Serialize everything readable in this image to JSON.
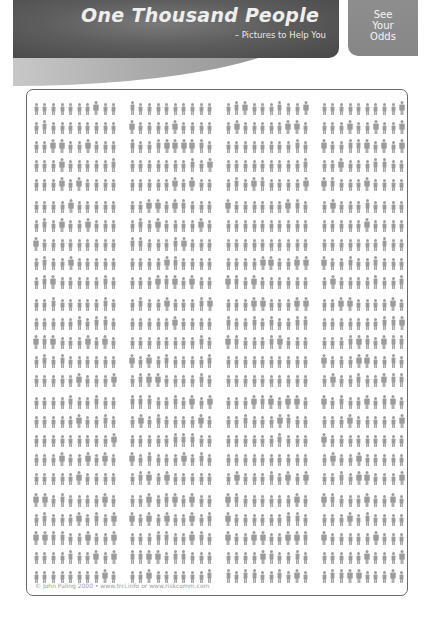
{
  "header": {
    "title": "One Thousand People",
    "subtitle": "– Pictures to Help You"
  },
  "odds_box": {
    "lines": [
      "See",
      "Your",
      "Odds"
    ]
  },
  "grid": {
    "total_people": 1000,
    "blocks": 5,
    "rows_per_block": 5,
    "groups_per_row": 4,
    "people_per_group": 10,
    "figure_color": "#9c9c9c",
    "figure_icon": "person-icon"
  },
  "footer": {
    "credit": "© John Paling 2000 • www.trci.info or www.riskcomm.com"
  },
  "colors": {
    "banner_dark": "#4a4a4a",
    "banner_mid": "#6e6e6e",
    "odds_bg": "#8a8a8a",
    "swoosh_light": "#c8c8c8",
    "panel_border": "#6a6a6a"
  }
}
